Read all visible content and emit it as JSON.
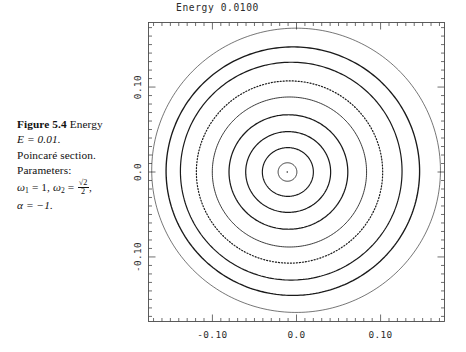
{
  "figure": {
    "caption": {
      "label": "Figure 5.4",
      "line1_rest": "Energy",
      "line2": "E = 0.01.",
      "line3": "Poincaré section.",
      "line4": "Parameters:",
      "line5_a": "ω",
      "line5_a_sub": "1",
      "line5_b": "= 1,",
      "line5_c": "ω",
      "line5_c_sub": "2",
      "line5_d": "=",
      "line5_frac_num": "√2",
      "line5_frac_den": "2",
      "line5_end": ",",
      "line6": "α = −1."
    }
  },
  "chart_data": {
    "type": "line",
    "title": "Energy 0.0100",
    "xlabel": "",
    "ylabel": "",
    "xlim": [
      -0.176,
      0.176
    ],
    "ylim": [
      -0.176,
      0.176
    ],
    "grid": false,
    "legend": null,
    "xticks": [
      -0.1,
      0.0,
      0.1
    ],
    "xticklabels": [
      "-0.10",
      "0.0",
      "0.10"
    ],
    "yticks": [
      0.1,
      0.0,
      -0.1
    ],
    "yticklabels": [
      "0.10",
      "0.0",
      "-0.10"
    ],
    "minor_ticks_per_interval": 10,
    "center": {
      "x": -0.009,
      "y": 0.001
    },
    "curves": [
      {
        "name": "torus-1-outer",
        "radius_x": 0.171,
        "radius_y": 0.168,
        "cx": -0.002,
        "cy": 0.002,
        "style": "solid",
        "width": 0.6
      },
      {
        "name": "torus-2",
        "radius_x": 0.15,
        "radius_y": 0.147,
        "cx": -0.006,
        "cy": 0.001,
        "style": "solid",
        "width": 1.35
      },
      {
        "name": "torus-3",
        "radius_x": 0.131,
        "radius_y": 0.129,
        "cx": -0.008,
        "cy": 0.001,
        "style": "solid",
        "width": 1.2
      },
      {
        "name": "torus-4-dotted",
        "radius_x": 0.11,
        "radius_y": 0.108,
        "cx": -0.01,
        "cy": 0.0,
        "style": "dotted",
        "width": 1.2
      },
      {
        "name": "torus-5",
        "radius_x": 0.091,
        "radius_y": 0.089,
        "cx": -0.01,
        "cy": 0.0,
        "style": "solid",
        "width": 0.85
      },
      {
        "name": "torus-6",
        "radius_x": 0.07,
        "radius_y": 0.068,
        "cx": -0.011,
        "cy": 0.0,
        "style": "solid",
        "width": 1.25
      },
      {
        "name": "torus-7",
        "radius_x": 0.05,
        "radius_y": 0.048,
        "cx": -0.011,
        "cy": 0.0,
        "style": "solid",
        "width": 1.2
      },
      {
        "name": "torus-8",
        "radius_x": 0.03,
        "radius_y": 0.029,
        "cx": -0.011,
        "cy": 0.0,
        "style": "solid",
        "width": 1.15
      },
      {
        "name": "torus-9-inner",
        "radius_x": 0.011,
        "radius_y": 0.011,
        "cx": -0.011,
        "cy": 0.0,
        "style": "solid",
        "width": 0.9
      }
    ],
    "fixed_point": {
      "x": -0.011,
      "y": 0.0
    }
  }
}
